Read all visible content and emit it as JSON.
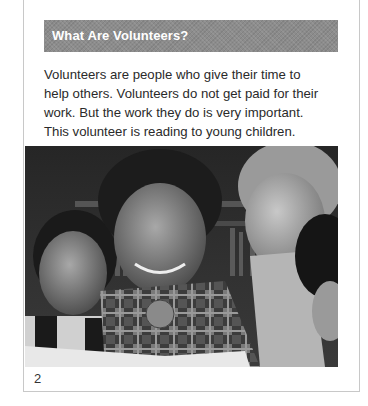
{
  "section": {
    "title": "What Are Volunteers?",
    "paragraph_lines": [
      "Volunteers are people who give their time to",
      "help others. Volunteers do not get paid for their",
      "work. But the work they do is very important.",
      "This volunteer is reading to young children."
    ]
  },
  "photo": {
    "description": "Black and white photo of a smiling girl volunteer reading a book to three young children in a library"
  },
  "page": {
    "number": "2"
  },
  "colors": {
    "header_bg": "#8c8c8c",
    "header_text": "#ffffff",
    "body_text": "#2a2a2a",
    "frame_border": "#c8c8c8"
  }
}
